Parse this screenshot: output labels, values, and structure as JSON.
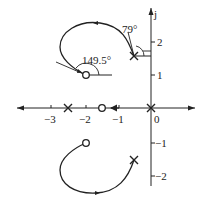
{
  "diagram": {
    "type": "root-locus",
    "axes": {
      "imag_label": "j",
      "x_ticks": [
        {
          "value": -3,
          "label": "−3"
        },
        {
          "value": -2,
          "label": "−2"
        },
        {
          "value": -1,
          "label": "−1"
        },
        {
          "value": 0,
          "label": "0"
        }
      ],
      "y_ticks": [
        {
          "value": 2,
          "label": "2"
        },
        {
          "value": 1,
          "label": "1"
        },
        {
          "value": -1,
          "label": "−1"
        },
        {
          "value": -2,
          "label": "−2"
        }
      ]
    },
    "poles": [
      {
        "re": 0,
        "im": 0
      },
      {
        "re": -2.5,
        "im": 0
      },
      {
        "re": -0.5,
        "im": 1.5
      },
      {
        "re": -0.5,
        "im": -1.5
      }
    ],
    "zeros": [
      {
        "re": -1.5,
        "im": 0
      },
      {
        "re": -2,
        "im": 1
      },
      {
        "re": -2,
        "im": -1
      }
    ],
    "annotations": {
      "departure_angle": "79°",
      "arrival_angle": "149.5°"
    }
  }
}
